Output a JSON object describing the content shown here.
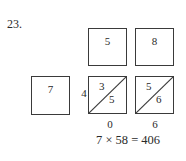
{
  "problem": {
    "number": "23."
  },
  "multiplicand_digits": [
    {
      "label": "5"
    },
    {
      "label": "8"
    }
  ],
  "multiplier": {
    "label": "7"
  },
  "lattice_cells": [
    {
      "tens": "3",
      "ones": "5"
    },
    {
      "tens": "5",
      "ones": "6"
    }
  ],
  "left_carry": "4",
  "bottom_sums": [
    "0",
    "6"
  ],
  "equation": "7 × 58 = 406"
}
